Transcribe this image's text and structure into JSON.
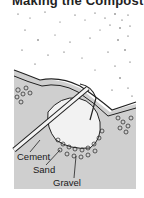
{
  "figure": {
    "title": "Making the Compost",
    "labels": {
      "cement": "Cement",
      "sand": "Sand",
      "gravel": "Gravel"
    },
    "colors": {
      "ground": "#cfcfcf",
      "ink": "#1a1a1a",
      "background": "#ffffff"
    }
  }
}
